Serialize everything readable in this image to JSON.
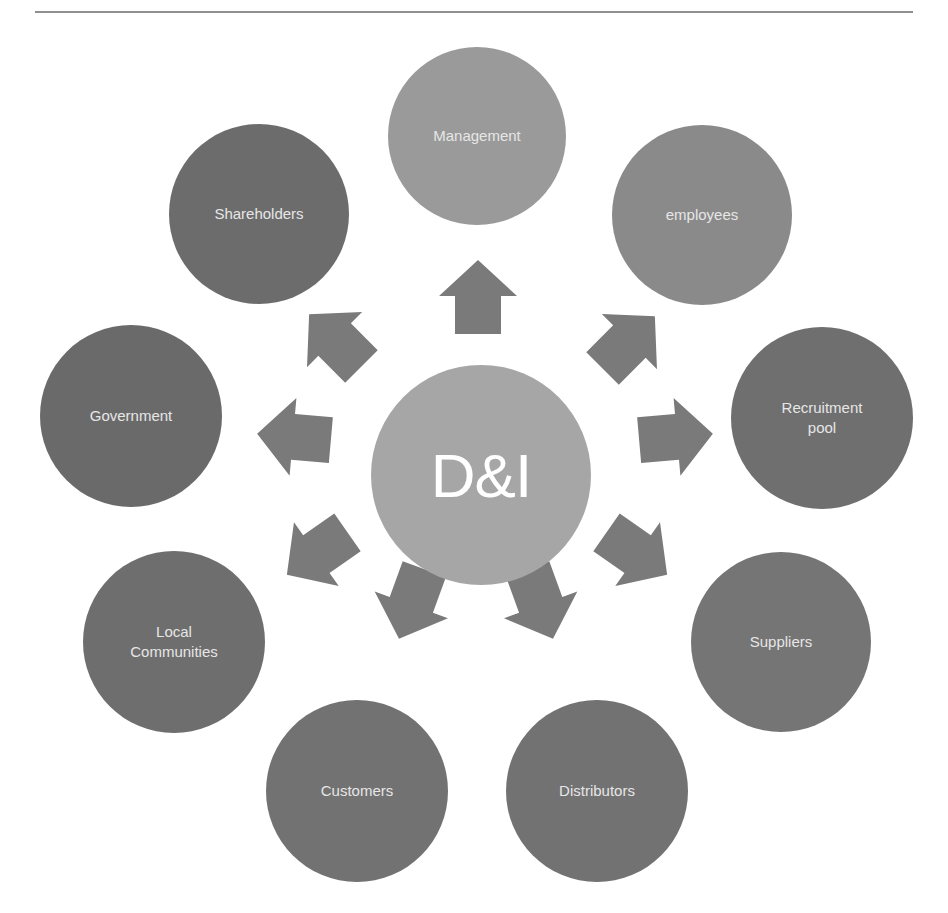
{
  "diagram": {
    "type": "radial-hub",
    "center": {
      "label": "D&I",
      "color": "#a6a6a6",
      "cx": 481,
      "cy": 475,
      "r": 110
    },
    "arrow_color": "#7a7a7a",
    "nodes": [
      {
        "id": "management",
        "label": "Management",
        "color": "#9a9a9a",
        "cx": 477,
        "cy": 136,
        "r": 89
      },
      {
        "id": "employees",
        "label": "employees",
        "color": "#8a8a8a",
        "cx": 702,
        "cy": 215,
        "r": 90
      },
      {
        "id": "recruitment-pool",
        "label": "Recruitment\npool",
        "color": "#6f6f6f",
        "cx": 822,
        "cy": 418,
        "r": 91
      },
      {
        "id": "suppliers",
        "label": "Suppliers",
        "color": "#757575",
        "cx": 781,
        "cy": 642,
        "r": 90
      },
      {
        "id": "distributors",
        "label": "Distributors",
        "color": "#727272",
        "cx": 597,
        "cy": 791,
        "r": 91
      },
      {
        "id": "customers",
        "label": "Customers",
        "color": "#727272",
        "cx": 357,
        "cy": 791,
        "r": 91
      },
      {
        "id": "local-communities",
        "label": "Local\nCommunities",
        "color": "#6e6e6e",
        "cx": 174,
        "cy": 642,
        "r": 91
      },
      {
        "id": "government",
        "label": "Government",
        "color": "#6a6a6a",
        "cx": 131,
        "cy": 416,
        "r": 91
      },
      {
        "id": "shareholders",
        "label": "Shareholders",
        "color": "#6c6c6c",
        "cx": 259,
        "cy": 214,
        "r": 90
      }
    ],
    "arrows": [
      {
        "target": "management",
        "cx": 478,
        "cy": 298,
        "angle": -90
      },
      {
        "target": "employees",
        "cx": 628,
        "cy": 343,
        "angle": -45
      },
      {
        "target": "recruitment-pool",
        "cx": 675,
        "cy": 437,
        "angle": -5
      },
      {
        "target": "suppliers",
        "cx": 636,
        "cy": 553,
        "angle": 35
      },
      {
        "target": "distributors",
        "cx": 540,
        "cy": 603,
        "angle": 70
      },
      {
        "target": "customers",
        "cx": 412,
        "cy": 603,
        "angle": 110
      },
      {
        "target": "local-communities",
        "cx": 318,
        "cy": 553,
        "angle": 145
      },
      {
        "target": "government",
        "cx": 295,
        "cy": 437,
        "angle": 185
      },
      {
        "target": "shareholders",
        "cx": 336,
        "cy": 341,
        "angle": 225
      }
    ]
  },
  "caption": {
    "text": ""
  }
}
